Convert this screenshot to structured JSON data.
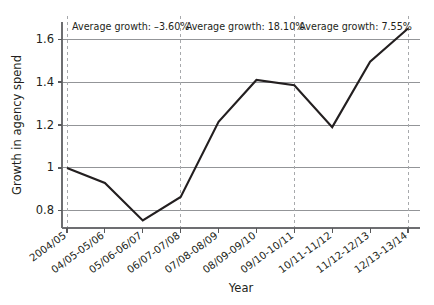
{
  "chart_data": {
    "type": "line",
    "title": "",
    "xlabel": "Year",
    "ylabel": "Growth in agency spend",
    "categories": [
      "2004/05",
      "04/05-05/06",
      "05/06-06/07",
      "06/07-07/08",
      "07/08-08/09",
      "08/09-09/10",
      "09/10-10/11",
      "10/11-11/12",
      "11/12-12/13",
      "12/13-13/14"
    ],
    "values": [
      1.0,
      0.93,
      0.755,
      0.865,
      1.215,
      1.41,
      1.385,
      1.19,
      1.495,
      1.65
    ],
    "ylim": [
      0.72,
      1.68
    ],
    "yticks": [
      0.8,
      1,
      1.2,
      1.4,
      1.6
    ],
    "ytick_labels": [
      "0.8",
      "1",
      "1.2",
      "1.4",
      "1.6"
    ],
    "grid": true,
    "legend": false,
    "series_color": "#231f20",
    "grid_color": "#939598",
    "separator_color": "#a7a9ac",
    "annotations": [
      {
        "text": "Average growth: –3.60%",
        "segment_start": "2004/05",
        "segment_end": "06/07-07/08",
        "value": -3.6,
        "unit": "%"
      },
      {
        "text": "Average growth: 18.10%",
        "segment_start": "06/07-07/08",
        "segment_end": "09/10-10/11",
        "value": 18.1,
        "unit": "%"
      },
      {
        "text": "Average growth: 7.55%",
        "segment_start": "09/10-10/11",
        "segment_end": "12/13-13/14",
        "value": 7.55,
        "unit": "%"
      }
    ],
    "separators": [
      "2004/05",
      "06/07-07/08",
      "09/10-10/11",
      "12/13-13/14"
    ]
  }
}
